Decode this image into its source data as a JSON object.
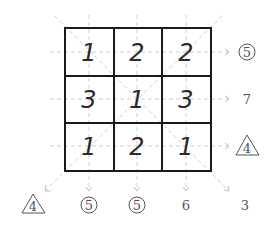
{
  "puzzle": {
    "grid": [
      [
        1,
        2,
        2
      ],
      [
        3,
        1,
        3
      ],
      [
        1,
        2,
        1
      ]
    ],
    "row_clues": [
      {
        "value": "5",
        "shape": "circle"
      },
      {
        "value": "7",
        "shape": "none"
      },
      {
        "value": "4",
        "shape": "triangle"
      }
    ],
    "column_clues": [
      {
        "value": "5",
        "shape": "circle"
      },
      {
        "value": "5",
        "shape": "circle"
      },
      {
        "value": "6",
        "shape": "none"
      }
    ],
    "diagonal_clues": {
      "anti_diagonal": {
        "value": "4",
        "shape": "triangle"
      },
      "main_diagonal": {
        "value": "3",
        "shape": "none"
      }
    }
  },
  "labels": {
    "r0c0": "1",
    "r0c1": "2",
    "r0c2": "2",
    "r1c0": "3",
    "r1c1": "1",
    "r1c2": "3",
    "r2c0": "1",
    "r2c1": "2",
    "r2c2": "1",
    "row0": "5",
    "row1": "7",
    "row2": "4",
    "col0": "5",
    "col1": "5",
    "col2": "6",
    "diag_anti": "4",
    "diag_main": "3"
  },
  "colors": {
    "grid_line": "#1a1a1a",
    "cell_digit": "#2a2a2a",
    "clue_text": "#555555",
    "guide_line": "#cfcfcf",
    "background": "#ffffff"
  }
}
